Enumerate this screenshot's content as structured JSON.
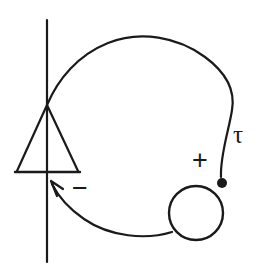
{
  "figure": {
    "width": 258,
    "height": 270,
    "background_color": "#ffffff",
    "ink_color": "#1a1a1a"
  },
  "labels": {
    "tau": {
      "text": "τ",
      "x": 233,
      "y": 122
    },
    "plus": {
      "text": "+",
      "x": 192,
      "y": 147
    },
    "minus": {
      "text": "−",
      "x": 72,
      "y": 175
    }
  },
  "elements": {
    "vertical_line": {
      "name": "vertical-line",
      "x": 47,
      "y_top": 20,
      "y_bottom": 262,
      "stroke_width": 2.2
    },
    "triangle": {
      "name": "triangle-symbol",
      "apex_x": 47,
      "apex_y": 105,
      "base_left_x": 17,
      "base_right_x": 78,
      "base_y": 172,
      "stroke_width": 2.2
    },
    "base_bar": {
      "name": "triangle-base-bar",
      "x1": 15,
      "x2": 80,
      "y": 172,
      "stroke_width": 2.4
    },
    "loop_curve": {
      "name": "loop-curve",
      "stroke_width": 2.2,
      "start_x": 47,
      "start_y": 105,
      "end_x": 222,
      "end_y": 182
    },
    "lower_curve": {
      "name": "lower-arrow-curve",
      "stroke_width": 2.2,
      "arrow_tip_x": 51,
      "arrow_tip_y": 182
    },
    "small_circle": {
      "name": "small-circle",
      "cx": 196,
      "cy": 213,
      "r": 27,
      "stroke_width": 2.4
    },
    "terminal_dot": {
      "name": "terminal-dot",
      "cx": 222,
      "cy": 183,
      "r": 5
    },
    "arrowhead": {
      "name": "arrowhead",
      "stroke_width": 2.2
    }
  }
}
